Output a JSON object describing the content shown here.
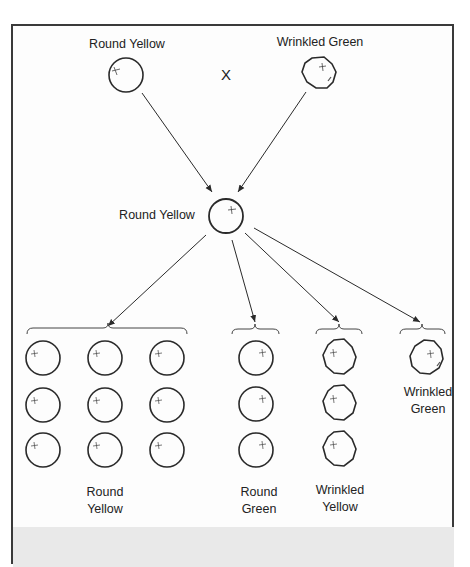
{
  "diagram": {
    "cross_symbol": "X",
    "parents": [
      {
        "label": "Round Yellow",
        "shape": "round",
        "x": 126,
        "y": 75
      },
      {
        "label": "Wrinkled Green",
        "shape": "wrinkled",
        "x": 318,
        "y": 74
      }
    ],
    "f1": {
      "label": "Round Yellow",
      "shape": "round",
      "x": 226,
      "y": 216
    },
    "f2_groups": [
      {
        "label_line1": "Round",
        "label_line2": "Yellow",
        "count": 9,
        "shape": "round"
      },
      {
        "label_line1": "Round",
        "label_line2": "Green",
        "count": 3,
        "shape": "round"
      },
      {
        "label_line1": "Wrinkled",
        "label_line2": "Yellow",
        "count": 3,
        "shape": "wrinkled"
      },
      {
        "label_line1": "Wrinkled",
        "label_line2": "Green",
        "count": 1,
        "shape": "wrinkled"
      }
    ],
    "ratio": "9:3:3:1",
    "footer_text_truncated": ""
  },
  "colors": {
    "line": "#2a2a2a",
    "frame": "#3a3a3a",
    "footer_band": "#e9e9e9",
    "background": "#fdfdfd"
  }
}
